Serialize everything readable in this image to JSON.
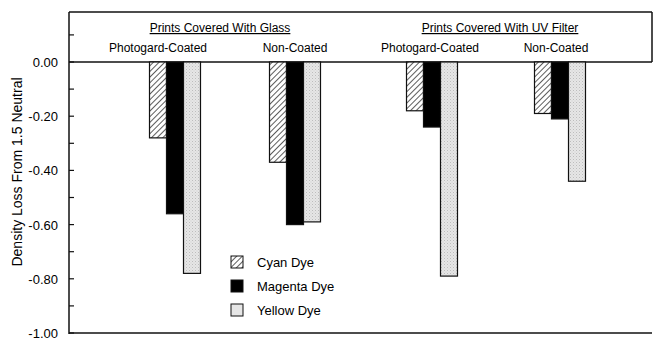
{
  "chart_data": {
    "type": "bar",
    "title": "",
    "xlabel": "",
    "ylabel": "Density Loss From 1.5 Neutral",
    "ylim": [
      -1.0,
      0.18
    ],
    "yticks": [
      "0.00",
      "-0.20",
      "-0.40",
      "-0.60",
      "-0.80",
      "-1.00"
    ],
    "grid": false,
    "legend_position": "lower-center-left, inside plot",
    "group_headers": [
      {
        "label": "Prints Covered With Glass",
        "underlined": true
      },
      {
        "label": "Prints Covered With UV Filter",
        "underlined": true
      }
    ],
    "categories": [
      "Photogard-Coated",
      "Non-Coated",
      "Photogard-Coated",
      "Non-Coated"
    ],
    "series": [
      {
        "name": "Cyan Dye",
        "pattern": "diagonal-hatch",
        "values": [
          -0.28,
          -0.37,
          -0.18,
          -0.19
        ]
      },
      {
        "name": "Magenta Dye",
        "pattern": "solid-black",
        "values": [
          -0.56,
          -0.6,
          -0.24,
          -0.21
        ]
      },
      {
        "name": "Yellow Dye",
        "pattern": "light-gray-stipple",
        "values": [
          -0.78,
          -0.59,
          -0.79,
          -0.44
        ]
      }
    ]
  },
  "colors": {
    "axis": "#111111",
    "magenta_fill": "#000000",
    "yellow_fill": "#e4e4e4",
    "cyan_hatch": "#333333"
  }
}
